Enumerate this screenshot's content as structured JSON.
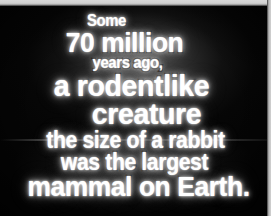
{
  "screen": {
    "name": "vhs-title-card",
    "background_color": "#050505",
    "edge_top_color": "#d2d2d2",
    "edge_right_color": "#c9c9c9",
    "scanline_color": "#ffffff",
    "text_color": "#ffffff",
    "outline_color": "#000000"
  },
  "caption": {
    "full_text": "Some 70 million years ago, a rodentlike creature the size of a rabbit was the largest mammal on Earth.",
    "lines": [
      {
        "text": "Some",
        "size": "small"
      },
      {
        "text": "70 million",
        "size": "large"
      },
      {
        "text": "years ago,",
        "size": "small"
      },
      {
        "text": "a rodentlike",
        "size": "xlarge"
      },
      {
        "text": "creature",
        "size": "xlarge"
      },
      {
        "text": "the size of a rabbit",
        "size": "medium"
      },
      {
        "text": "was the largest",
        "size": "medium"
      },
      {
        "text": "mammal on Earth.",
        "size": "large"
      }
    ]
  }
}
